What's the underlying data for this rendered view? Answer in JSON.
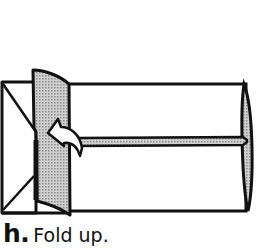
{
  "caption": {
    "step_letter": "h.",
    "instruction": "Fold up."
  },
  "colors": {
    "line": "#111111",
    "shade": "#bdbdbd",
    "paper": "#ffffff"
  },
  "diagram": {
    "arrow": "curved fold-up arrow"
  }
}
